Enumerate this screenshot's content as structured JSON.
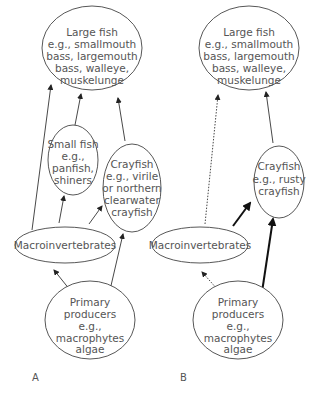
{
  "panels": {
    "A": {
      "label": "A",
      "nodes": {
        "large_fish": [
          "Large fish",
          "e.g., smallmouth",
          "bass, largemouth",
          "bass, walleye,",
          "muskelunge"
        ],
        "small_fish": [
          "Small fish",
          "e.g.,",
          "panfish,",
          "shiners"
        ],
        "crayfish": [
          "Crayfish",
          "e.g., virile",
          "or northern",
          "clearwater",
          "crayfish"
        ],
        "macroinvertebrates": [
          "Macroinvertebrates"
        ],
        "primary_producers": [
          "Primary",
          "producers",
          "e.g.,",
          "macrophytes",
          "algae"
        ]
      },
      "edges": [
        {
          "from": "macroinvertebrates",
          "to": "large_fish",
          "style": "solid"
        },
        {
          "from": "small_fish",
          "to": "large_fish",
          "style": "solid"
        },
        {
          "from": "crayfish",
          "to": "large_fish",
          "style": "solid"
        },
        {
          "from": "macroinvertebrates",
          "to": "small_fish",
          "style": "solid"
        },
        {
          "from": "macroinvertebrates",
          "to": "crayfish",
          "style": "solid"
        },
        {
          "from": "primary_producers",
          "to": "macroinvertebrates",
          "style": "solid"
        },
        {
          "from": "primary_producers",
          "to": "crayfish",
          "style": "solid"
        }
      ]
    },
    "B": {
      "label": "B",
      "nodes": {
        "large_fish": [
          "Large fish",
          "e.g., smallmouth",
          "bass, largemouth",
          "bass, walleye,",
          "muskelunge"
        ],
        "crayfish": [
          "Crayfish",
          "e.g., rusty",
          "crayfish"
        ],
        "macroinvertebrates": [
          "Macroinvertebrates"
        ],
        "primary_producers": [
          "Primary",
          "producers",
          "e.g.,",
          "macrophytes",
          "algae"
        ]
      },
      "edges": [
        {
          "from": "macroinvertebrates",
          "to": "large_fish",
          "style": "dotted"
        },
        {
          "from": "crayfish",
          "to": "large_fish",
          "style": "solid"
        },
        {
          "from": "macroinvertebrates",
          "to": "crayfish",
          "style": "bold"
        },
        {
          "from": "primary_producers",
          "to": "macroinvertebrates",
          "style": "dotted"
        },
        {
          "from": "primary_producers",
          "to": "crayfish",
          "style": "bold"
        }
      ]
    }
  }
}
